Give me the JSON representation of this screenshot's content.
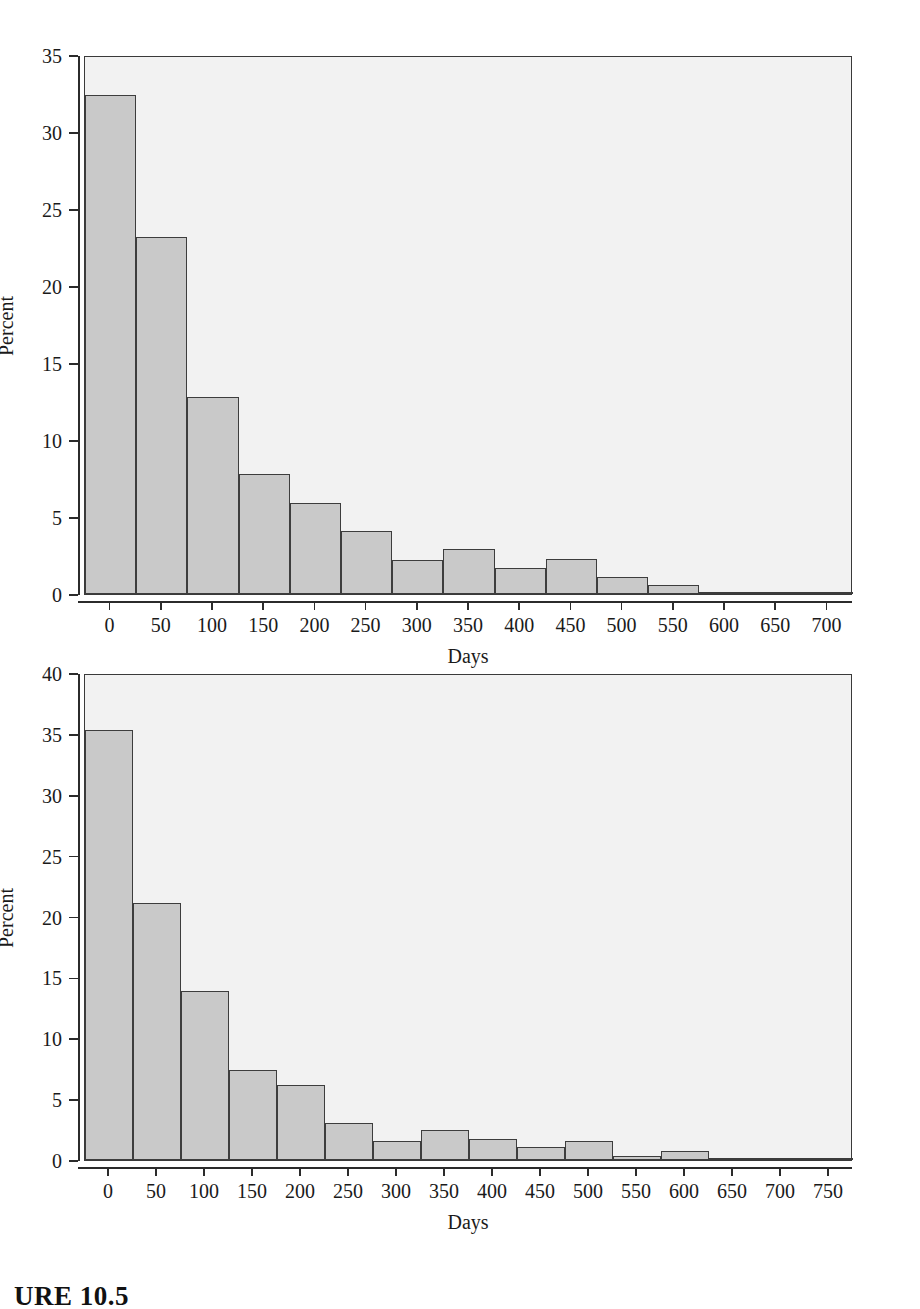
{
  "document": {
    "caption": "URE 10.5"
  },
  "charts": [
    {
      "id": "chart-top",
      "axis_y_title": "Percent",
      "axis_x_title": "Days",
      "y_ticks": [
        "0",
        "5",
        "10",
        "15",
        "20",
        "25",
        "30",
        "35"
      ],
      "x_ticks": [
        "0",
        "50",
        "100",
        "150",
        "200",
        "250",
        "300",
        "350",
        "400",
        "450",
        "500",
        "550",
        "600",
        "650",
        "700"
      ]
    },
    {
      "id": "chart-bottom",
      "axis_y_title": "Percent",
      "axis_x_title": "Days",
      "y_ticks": [
        "0",
        "5",
        "10",
        "15",
        "20",
        "25",
        "30",
        "35",
        "40"
      ],
      "x_ticks": [
        "0",
        "50",
        "100",
        "150",
        "200",
        "250",
        "300",
        "350",
        "400",
        "450",
        "500",
        "550",
        "600",
        "650",
        "700",
        "750"
      ]
    }
  ],
  "chart_data": [
    {
      "type": "bar",
      "title": "",
      "subtitle": "",
      "xlabel": "Days",
      "ylabel": "Percent",
      "ylim": [
        0,
        35
      ],
      "xlim": [
        -25,
        725
      ],
      "grid": false,
      "legend": null,
      "bin_width": 50,
      "bin_starts": [
        -25,
        25,
        75,
        125,
        175,
        225,
        275,
        325,
        375,
        425,
        475,
        525,
        575,
        625,
        675
      ],
      "categories": [
        "0",
        "50",
        "100",
        "150",
        "200",
        "250",
        "300",
        "350",
        "400",
        "450",
        "500",
        "550",
        "600",
        "650",
        "700"
      ],
      "values": [
        32.4,
        23.2,
        12.8,
        7.8,
        5.9,
        4.1,
        2.2,
        2.9,
        1.7,
        2.3,
        1.1,
        0.6,
        0.1,
        0.0,
        0.15
      ],
      "bar_face_color": "#c9c9c9",
      "bar_edge_color": "#3d3d3d",
      "panel_color": "#f2f2f2"
    },
    {
      "type": "bar",
      "title": "",
      "subtitle": "",
      "xlabel": "Days",
      "ylabel": "Percent",
      "ylim": [
        0,
        40
      ],
      "xlim": [
        -25,
        775
      ],
      "grid": false,
      "legend": null,
      "bin_width": 50,
      "bin_starts": [
        -25,
        25,
        75,
        125,
        175,
        225,
        275,
        325,
        375,
        425,
        475,
        525,
        575,
        625,
        675,
        725
      ],
      "categories": [
        "0",
        "50",
        "100",
        "150",
        "200",
        "250",
        "300",
        "350",
        "400",
        "450",
        "500",
        "550",
        "600",
        "650",
        "700",
        "750"
      ],
      "values": [
        35.3,
        21.1,
        13.9,
        7.4,
        6.2,
        3.0,
        1.6,
        2.5,
        1.7,
        1.1,
        1.6,
        0.3,
        0.75,
        0.1,
        0.1,
        0.05
      ],
      "bar_face_color": "#c9c9c9",
      "bar_edge_color": "#3d3d3d",
      "panel_color": "#f2f2f2"
    }
  ]
}
